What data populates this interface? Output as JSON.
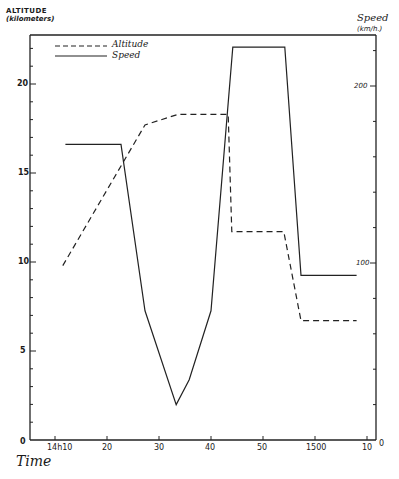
{
  "chart_data": {
    "type": "line",
    "title": "",
    "xlabel": "Time",
    "ylabel_left": "ALTITUDE (kilometers)",
    "ylabel_right": "Speed (km/h.)",
    "x_tick_labels": [
      "0",
      "14h10",
      "20",
      "30",
      "40",
      "50",
      "1500",
      "10"
    ],
    "y_left_tick_labels": [
      "0",
      "5",
      "10",
      "15",
      "20"
    ],
    "y_right_tick_labels": [
      "0",
      "100",
      "200"
    ],
    "x_unit": "minutes after 14h10",
    "y_left_range": [
      0,
      22.7
    ],
    "y_right_range": [
      0,
      230
    ],
    "grid": false,
    "legend_position": "top-left inside",
    "series": [
      {
        "name": "Altitude",
        "axis": "left",
        "style": "dashed",
        "points": [
          [
            1.5,
            9.8
          ],
          [
            17.3,
            17.7
          ],
          [
            23.7,
            18.3
          ],
          [
            33.3,
            18.3
          ],
          [
            34.0,
            11.7
          ],
          [
            44.0,
            11.7
          ],
          [
            47.3,
            6.7
          ],
          [
            58.0,
            6.7
          ]
        ]
      },
      {
        "name": "Speed",
        "axis": "right",
        "style": "solid",
        "points": [
          [
            2.0,
            167
          ],
          [
            12.7,
            167
          ],
          [
            17.3,
            73
          ],
          [
            23.3,
            20
          ],
          [
            25.8,
            34
          ],
          [
            30.0,
            73
          ],
          [
            34.2,
            222
          ],
          [
            44.2,
            222
          ],
          [
            47.3,
            93
          ],
          [
            58.0,
            93
          ]
        ]
      }
    ]
  },
  "labels": {
    "y_left_title": "ALTITUDE",
    "y_left_sub": "(kilometers)",
    "y_right_title": "Speed",
    "y_right_sub": "(km/h.)",
    "x_title": "Time",
    "legend_altitude": "Altitude",
    "legend_speed": "Speed",
    "x_ticks": [
      "14h10",
      "20",
      "30",
      "40",
      "50",
      "1500",
      "10"
    ],
    "x_origin": "0",
    "x_right_origin": "0",
    "y_left_ticks": [
      "5",
      "10",
      "15",
      "20"
    ],
    "y_right_ticks": [
      "100",
      "200"
    ]
  }
}
